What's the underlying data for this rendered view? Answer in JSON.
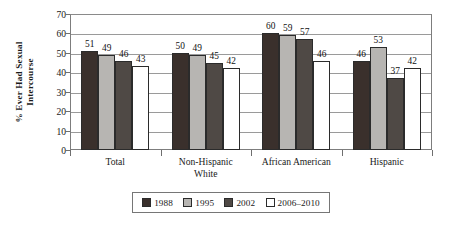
{
  "chart_data": {
    "type": "bar",
    "title": "",
    "xlabel": "",
    "ylabel": "% Ever Had Sexual Intercourse",
    "ylabel_lines": [
      "% Ever Had Sexual",
      "Intercourse"
    ],
    "ylim": [
      0,
      70
    ],
    "yticks": [
      0,
      10,
      20,
      30,
      40,
      50,
      60,
      70
    ],
    "ytick_labels": [
      "0",
      "10",
      "20",
      "30",
      "40",
      "50",
      "60",
      "70"
    ],
    "grid": true,
    "grid_axis": "y",
    "legend_position": "bottom",
    "categories": [
      "Total",
      "Non-Hispanic White",
      "African American",
      "Hispanic"
    ],
    "category_label_lines": [
      [
        "Total"
      ],
      [
        "Non-Hispanic",
        "White"
      ],
      [
        "African American"
      ],
      [
        "Hispanic"
      ]
    ],
    "series": [
      {
        "name": "1988",
        "color": "#3a302c",
        "values": [
          51,
          50,
          60,
          46
        ]
      },
      {
        "name": "1995",
        "color": "#b7b5b2",
        "values": [
          49,
          49,
          59,
          53
        ]
      },
      {
        "name": "2002",
        "color": "#4f4945",
        "values": [
          46,
          45,
          57,
          37
        ]
      },
      {
        "name": "2006–2010",
        "color": "#ffffff",
        "values": [
          43,
          42,
          46,
          42
        ]
      }
    ],
    "data_labels": [
      [
        "51",
        "49",
        "46",
        "43"
      ],
      [
        "50",
        "49",
        "45",
        "42"
      ],
      [
        "60",
        "59",
        "57",
        "46"
      ],
      [
        "46",
        "53",
        "37",
        "42"
      ]
    ]
  },
  "legend": {
    "items": [
      {
        "label": "1988",
        "color": "#3a302c"
      },
      {
        "label": "1995",
        "color": "#b7b5b2"
      },
      {
        "label": "2002",
        "color": "#4f4945"
      },
      {
        "label": "2006–2010",
        "color": "#ffffff"
      }
    ]
  },
  "colors": {
    "axis": "#7d7d7d",
    "grid": "#9a9a9a",
    "bar_outline": "#2b2b2b",
    "background": "#ffffff",
    "text": "#1a1a1a"
  }
}
